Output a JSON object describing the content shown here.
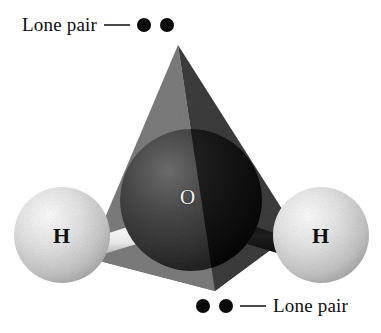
{
  "figure": {
    "background_color": "#ffffff"
  },
  "labels": {
    "lone_pair_top": "Lone pair",
    "lone_pair_bottom": "Lone pair"
  },
  "atoms": [
    {
      "id": "oxygen",
      "symbol": "O",
      "color": "#2e2e2e",
      "label_color": "#f2f2f2"
    },
    {
      "id": "hydrogen-left",
      "symbol": "H",
      "color": "#d9d9d9",
      "label_color": "#111111"
    },
    {
      "id": "hydrogen-right",
      "symbol": "H",
      "color": "#d9d9d9",
      "label_color": "#111111"
    }
  ],
  "lone_pairs": [
    {
      "id": "lone-pair-top",
      "position": "top",
      "dot_count": 2,
      "dot_color": "#0a0a0a"
    },
    {
      "id": "lone-pair-bottom",
      "position": "bottom",
      "dot_count": 2,
      "dot_color": "#0a0a0a"
    }
  ],
  "tetrahedron": {
    "face_left_color": "#7d7d7d",
    "face_right_color": "#3c3c3c",
    "face_base_color": "#6b6b6b",
    "apex": {
      "x": 178,
      "y": 45
    }
  },
  "bonds": [
    {
      "id": "bond-o-h-left",
      "color": "#f0f0f0"
    },
    {
      "id": "bond-o-h-right",
      "color": "#161616"
    }
  ],
  "colors": {
    "dash": "#4a4a4a",
    "dot": "#0a0a0a",
    "text": "#0d0d0d"
  }
}
